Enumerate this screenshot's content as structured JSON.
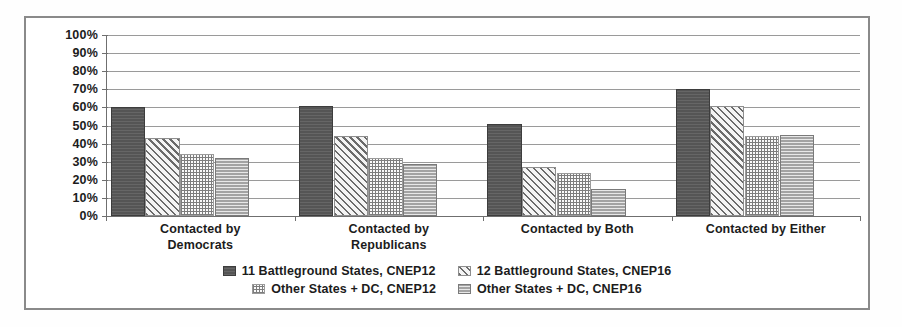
{
  "chart_data": {
    "type": "bar",
    "title": "",
    "xlabel": "",
    "ylabel": "",
    "ylim": [
      0,
      100
    ],
    "grid": true,
    "legend_position": "bottom",
    "categories": [
      "Contacted by Democrats",
      "Contacted by Republicans",
      "Contacted by Both",
      "Contacted by Either"
    ],
    "category_lines": [
      [
        "Contacted by",
        "Democrats"
      ],
      [
        "Contacted by",
        "Republicans"
      ],
      [
        "Contacted by Both",
        ""
      ],
      [
        "Contacted by Either",
        ""
      ]
    ],
    "ytick_labels": [
      "100%",
      "90%",
      "80%",
      "70%",
      "60%",
      "50%",
      "40%",
      "30%",
      "20%",
      "10%",
      "0%"
    ],
    "ytick_values": [
      100,
      90,
      80,
      70,
      60,
      50,
      40,
      30,
      20,
      10,
      0
    ],
    "series": [
      {
        "name": "11 Battleground States, CNEP12",
        "pattern": "solid-dark-gray",
        "color": "#555555",
        "values": [
          60,
          61,
          51,
          70
        ]
      },
      {
        "name": "12 Battleground States, CNEP16",
        "pattern": "diagonal-hatch",
        "color": "#6b6b6b",
        "values": [
          43,
          44,
          27,
          61
        ]
      },
      {
        "name": "Other States + DC, CNEP12",
        "pattern": "cross-dot",
        "color": "#7d7d7d",
        "values": [
          34,
          32,
          24,
          44
        ]
      },
      {
        "name": "Other States + DC, CNEP16",
        "pattern": "horizontal-line-gray",
        "color": "#a3a3a3",
        "values": [
          32,
          29,
          15,
          45
        ]
      }
    ]
  },
  "legend": {
    "rows": [
      [
        {
          "label": "11 Battleground States, CNEP12",
          "series": 0
        },
        {
          "label": "12 Battleground States, CNEP16",
          "series": 1
        }
      ],
      [
        {
          "label": "Other States + DC, CNEP12",
          "series": 2
        },
        {
          "label": "Other States + DC, CNEP16",
          "series": 3
        }
      ]
    ]
  }
}
